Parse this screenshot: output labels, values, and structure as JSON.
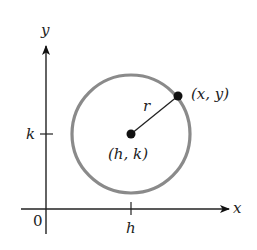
{
  "diagram": {
    "axes": {
      "x_label": "x",
      "y_label": "y",
      "origin_label": "0",
      "x_tick_label": "h",
      "y_tick_label": "k"
    },
    "circle": {
      "center_label": "(h, k)",
      "point_label": "(x, y)",
      "radius_label": "r"
    },
    "colors": {
      "circle_stroke": "#8a8a8a",
      "axis": "#222222",
      "point": "#111111"
    }
  }
}
